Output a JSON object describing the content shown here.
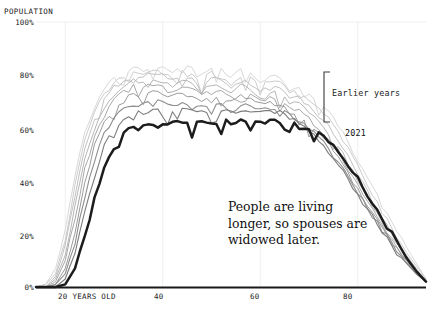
{
  "chart_data": {
    "type": "line",
    "title": "POPULATION",
    "xlabel": "YEARS OLD",
    "ylabel": "POPULATION",
    "xlim": [
      14,
      94
    ],
    "ylim": [
      0,
      100
    ],
    "grid": true,
    "y_tick_labels": [
      "100%",
      "80%",
      "60%",
      "40%",
      "20%",
      "0%"
    ],
    "y_ticks": [
      100,
      80,
      60,
      40,
      20,
      0
    ],
    "x_tick_labels": [
      "20 YEARS OLD",
      "40",
      "60",
      "80"
    ],
    "x_ticks": [
      20,
      40,
      60,
      80
    ],
    "annotations": [
      {
        "name": "callout",
        "text": "People are living longer, so spouses are widowed later."
      },
      {
        "name": "bracket-label",
        "text": "Earlier years"
      },
      {
        "name": "current-series-label",
        "text": "2021"
      }
    ],
    "legend_position": "inline-right",
    "colors": {
      "current_series": "#1c1c1c",
      "earlier_series_light": "#cfcfcf",
      "earlier_series_dark": "#8a8a8a",
      "grid": "#efefef",
      "axis": "#1a1a1a",
      "text": "#111111"
    },
    "x": [
      14,
      16,
      18,
      20,
      22,
      24,
      26,
      28,
      30,
      32,
      34,
      36,
      38,
      40,
      42,
      44,
      46,
      48,
      50,
      52,
      54,
      56,
      58,
      60,
      62,
      64,
      66,
      68,
      70,
      72,
      74,
      76,
      78,
      80,
      82,
      84,
      86,
      88,
      90,
      92,
      94
    ],
    "series": [
      {
        "name": "Earliest year",
        "shade": "#d8d8d8",
        "width": 1.0,
        "values": [
          0,
          1,
          7,
          22,
          42,
          58,
          68,
          75,
          79,
          81,
          83,
          82,
          84,
          83,
          81,
          84,
          83,
          80,
          83,
          82,
          79,
          82,
          81,
          78,
          80,
          79,
          75,
          76,
          73,
          70,
          66,
          61,
          55,
          48,
          41,
          34,
          27,
          21,
          15,
          9,
          3
        ]
      },
      {
        "name": "Earlier year 2",
        "shade": "#cccccc",
        "width": 1.0,
        "values": [
          0,
          1,
          5,
          18,
          38,
          55,
          66,
          73,
          77,
          80,
          81,
          80,
          82,
          81,
          79,
          82,
          81,
          78,
          81,
          80,
          77,
          80,
          79,
          76,
          78,
          77,
          74,
          74,
          71,
          68,
          64,
          59,
          53,
          46,
          39,
          32,
          25,
          19,
          13,
          8,
          3
        ]
      },
      {
        "name": "Earlier year 3",
        "shade": "#c2c2c2",
        "width": 1.0,
        "values": [
          0,
          0,
          4,
          15,
          34,
          52,
          63,
          71,
          76,
          78,
          80,
          79,
          81,
          80,
          78,
          80,
          79,
          76,
          79,
          78,
          75,
          78,
          77,
          74,
          76,
          75,
          72,
          72,
          68,
          65,
          61,
          56,
          50,
          43,
          36,
          29,
          23,
          17,
          12,
          7,
          2
        ]
      },
      {
        "name": "Earlier year 4",
        "shade": "#b6b6b6",
        "width": 1.0,
        "values": [
          0,
          0,
          3,
          12,
          30,
          48,
          60,
          68,
          73,
          76,
          78,
          77,
          79,
          78,
          76,
          78,
          77,
          74,
          77,
          76,
          73,
          76,
          75,
          72,
          74,
          73,
          70,
          69,
          66,
          62,
          58,
          53,
          47,
          40,
          34,
          27,
          21,
          16,
          11,
          6,
          2
        ]
      },
      {
        "name": "Earlier year 5",
        "shade": "#a8a8a8",
        "width": 1.0,
        "values": [
          0,
          0,
          2,
          10,
          26,
          44,
          57,
          65,
          71,
          74,
          76,
          75,
          77,
          76,
          74,
          76,
          75,
          73,
          75,
          74,
          72,
          74,
          73,
          70,
          72,
          71,
          68,
          67,
          64,
          60,
          56,
          51,
          45,
          38,
          32,
          26,
          20,
          15,
          10,
          6,
          2
        ]
      },
      {
        "name": "Earlier year 6",
        "shade": "#9a9a9a",
        "width": 1.0,
        "values": [
          0,
          0,
          1,
          7,
          21,
          39,
          53,
          62,
          68,
          71,
          73,
          72,
          74,
          73,
          72,
          73,
          72,
          71,
          72,
          72,
          70,
          72,
          71,
          69,
          70,
          69,
          66,
          65,
          62,
          58,
          54,
          49,
          43,
          37,
          31,
          25,
          19,
          14,
          10,
          5,
          2
        ]
      },
      {
        "name": "Earlier year 7",
        "shade": "#8e8e8e",
        "width": 1.1,
        "values": [
          0,
          0,
          1,
          5,
          17,
          34,
          48,
          58,
          64,
          67,
          69,
          69,
          70,
          70,
          69,
          70,
          69,
          68,
          69,
          69,
          68,
          69,
          69,
          67,
          68,
          67,
          65,
          63,
          60,
          57,
          52,
          47,
          42,
          36,
          30,
          24,
          19,
          14,
          9,
          5,
          2
        ]
      },
      {
        "name": "Earlier year 8",
        "shade": "#7d7d7d",
        "width": 1.1,
        "values": [
          0,
          0,
          0,
          3,
          13,
          28,
          42,
          53,
          60,
          64,
          66,
          66,
          67,
          67,
          66,
          67,
          67,
          66,
          67,
          67,
          66,
          67,
          67,
          66,
          66,
          66,
          64,
          62,
          59,
          56,
          51,
          46,
          41,
          35,
          29,
          24,
          18,
          13,
          9,
          5,
          2
        ]
      },
      {
        "name": "2021",
        "shade": "#1c1c1c",
        "width": 2.5,
        "values": [
          0,
          0,
          0,
          1,
          7,
          19,
          33,
          45,
          53,
          58,
          61,
          61,
          62,
          62,
          62,
          62,
          62,
          62,
          62,
          63,
          62,
          63,
          63,
          62,
          63,
          63,
          62,
          61,
          60,
          58,
          55,
          51,
          46,
          41,
          35,
          29,
          23,
          17,
          11,
          6,
          2
        ]
      }
    ]
  }
}
